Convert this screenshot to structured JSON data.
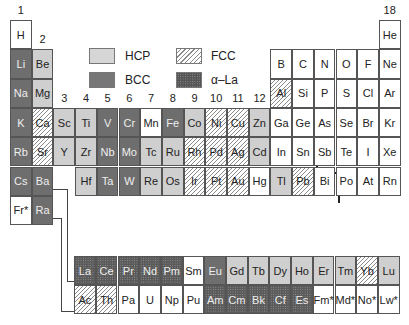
{
  "legend": [
    {
      "key": "hcp",
      "label": "HCP"
    },
    {
      "key": "bcc",
      "label": "BCC"
    },
    {
      "key": "fcc",
      "label": "FCC"
    },
    {
      "key": "ala",
      "label": "α–La"
    }
  ],
  "group_labels": [
    "1",
    "2",
    "3",
    "4",
    "5",
    "6",
    "7",
    "8",
    "9",
    "10",
    "11",
    "12",
    "13",
    "14",
    "15",
    "16",
    "17",
    "18"
  ],
  "main_table": [
    [
      {
        "s": "H",
        "t": "none",
        "c": 1
      },
      {
        "s": "He",
        "t": "none",
        "c": 18
      }
    ],
    [
      {
        "s": "Li",
        "t": "bcc",
        "c": 1
      },
      {
        "s": "Be",
        "t": "hcp",
        "c": 2
      },
      {
        "s": "B",
        "t": "none",
        "c": 13
      },
      {
        "s": "C",
        "t": "none",
        "c": 14
      },
      {
        "s": "N",
        "t": "none",
        "c": 15
      },
      {
        "s": "O",
        "t": "none",
        "c": 16
      },
      {
        "s": "F",
        "t": "none",
        "c": 17
      },
      {
        "s": "Ne",
        "t": "none",
        "c": 18
      }
    ],
    [
      {
        "s": "Na",
        "t": "bcc",
        "c": 1
      },
      {
        "s": "Mg",
        "t": "hcp",
        "c": 2
      },
      {
        "s": "Al",
        "t": "fcc",
        "c": 13
      },
      {
        "s": "Si",
        "t": "none",
        "c": 14
      },
      {
        "s": "P",
        "t": "none",
        "c": 15
      },
      {
        "s": "S",
        "t": "none",
        "c": 16
      },
      {
        "s": "Cl",
        "t": "none",
        "c": 17
      },
      {
        "s": "Ar",
        "t": "none",
        "c": 18
      }
    ],
    [
      {
        "s": "K",
        "t": "bcc",
        "c": 1
      },
      {
        "s": "Ca",
        "t": "fcc",
        "c": 2
      },
      {
        "s": "Sc",
        "t": "hcp",
        "c": 3
      },
      {
        "s": "Ti",
        "t": "hcp",
        "c": 4
      },
      {
        "s": "V",
        "t": "bcc",
        "c": 5
      },
      {
        "s": "Cr",
        "t": "bcc",
        "c": 6
      },
      {
        "s": "Mn",
        "t": "none",
        "c": 7
      },
      {
        "s": "Fe",
        "t": "bcc",
        "c": 8
      },
      {
        "s": "Co",
        "t": "hcp",
        "c": 9
      },
      {
        "s": "Ni",
        "t": "fcc",
        "c": 10
      },
      {
        "s": "Cu",
        "t": "fcc",
        "c": 11
      },
      {
        "s": "Zn",
        "t": "hcp",
        "c": 12
      },
      {
        "s": "Ga",
        "t": "none",
        "c": 13
      },
      {
        "s": "Ge",
        "t": "none",
        "c": 14
      },
      {
        "s": "As",
        "t": "none",
        "c": 15
      },
      {
        "s": "Se",
        "t": "none",
        "c": 16
      },
      {
        "s": "Br",
        "t": "none",
        "c": 17
      },
      {
        "s": "Kr",
        "t": "none",
        "c": 18
      }
    ],
    [
      {
        "s": "Rb",
        "t": "bcc",
        "c": 1
      },
      {
        "s": "Sr",
        "t": "fcc",
        "c": 2
      },
      {
        "s": "Y",
        "t": "hcp",
        "c": 3
      },
      {
        "s": "Zr",
        "t": "hcp",
        "c": 4
      },
      {
        "s": "Nb",
        "t": "bcc",
        "c": 5
      },
      {
        "s": "Mo",
        "t": "bcc",
        "c": 6
      },
      {
        "s": "Tc",
        "t": "hcp",
        "c": 7
      },
      {
        "s": "Ru",
        "t": "hcp",
        "c": 8
      },
      {
        "s": "Rh",
        "t": "fcc",
        "c": 9
      },
      {
        "s": "Pd",
        "t": "fcc",
        "c": 10
      },
      {
        "s": "Ag",
        "t": "fcc",
        "c": 11
      },
      {
        "s": "Cd",
        "t": "hcp",
        "c": 12
      },
      {
        "s": "In",
        "t": "none",
        "c": 13
      },
      {
        "s": "Sn",
        "t": "none",
        "c": 14
      },
      {
        "s": "Sb",
        "t": "none",
        "c": 15
      },
      {
        "s": "Te",
        "t": "none",
        "c": 16
      },
      {
        "s": "I",
        "t": "none",
        "c": 17
      },
      {
        "s": "Xe",
        "t": "none",
        "c": 18
      }
    ],
    [
      {
        "s": "Cs",
        "t": "bcc",
        "c": 1
      },
      {
        "s": "Ba",
        "t": "bcc",
        "c": 2
      },
      {
        "s": "Hf",
        "t": "hcp",
        "c": 4
      },
      {
        "s": "Ta",
        "t": "bcc",
        "c": 5
      },
      {
        "s": "W",
        "t": "bcc",
        "c": 6
      },
      {
        "s": "Re",
        "t": "hcp",
        "c": 7
      },
      {
        "s": "Os",
        "t": "hcp",
        "c": 8
      },
      {
        "s": "Ir",
        "t": "fcc",
        "c": 9
      },
      {
        "s": "Pt",
        "t": "fcc",
        "c": 10
      },
      {
        "s": "Au",
        "t": "fcc",
        "c": 11
      },
      {
        "s": "Hg",
        "t": "none",
        "c": 12
      },
      {
        "s": "Tl",
        "t": "hcp",
        "c": 13
      },
      {
        "s": "Pb",
        "t": "fcc",
        "c": 14
      },
      {
        "s": "Bi",
        "t": "none",
        "c": 15
      },
      {
        "s": "Po",
        "t": "none",
        "c": 16
      },
      {
        "s": "At",
        "t": "none",
        "c": 17
      },
      {
        "s": "Rn",
        "t": "none",
        "c": 18
      }
    ],
    [
      {
        "s": "Fr*",
        "t": "none",
        "c": 1
      },
      {
        "s": "Ra",
        "t": "bcc",
        "c": 2
      }
    ]
  ],
  "lanthanides": [
    {
      "s": "La",
      "t": "ala"
    },
    {
      "s": "Ce",
      "t": "ala"
    },
    {
      "s": "Pr",
      "t": "ala"
    },
    {
      "s": "Nd",
      "t": "ala"
    },
    {
      "s": "Pm",
      "t": "ala"
    },
    {
      "s": "Sm",
      "t": "none"
    },
    {
      "s": "Eu",
      "t": "bcc"
    },
    {
      "s": "Gd",
      "t": "hcp"
    },
    {
      "s": "Tb",
      "t": "hcp"
    },
    {
      "s": "Dy",
      "t": "hcp"
    },
    {
      "s": "Ho",
      "t": "hcp"
    },
    {
      "s": "Er",
      "t": "hcp"
    },
    {
      "s": "Tm",
      "t": "hcp"
    },
    {
      "s": "Yb",
      "t": "fcc"
    },
    {
      "s": "Lu",
      "t": "hcp"
    }
  ],
  "actinides": [
    {
      "s": "Ac",
      "t": "fcc"
    },
    {
      "s": "Th",
      "t": "fcc"
    },
    {
      "s": "Pa",
      "t": "none"
    },
    {
      "s": "U",
      "t": "none"
    },
    {
      "s": "Np",
      "t": "none"
    },
    {
      "s": "Pu",
      "t": "none"
    },
    {
      "s": "Am",
      "t": "ala"
    },
    {
      "s": "Cm",
      "t": "ala"
    },
    {
      "s": "Bk",
      "t": "ala"
    },
    {
      "s": "Cf",
      "t": "ala"
    },
    {
      "s": "Es",
      "t": "ala"
    },
    {
      "s": "Fm*",
      "t": "none"
    },
    {
      "s": "Md*",
      "t": "none"
    },
    {
      "s": "No*",
      "t": "none"
    },
    {
      "s": "Lw*",
      "t": "none"
    }
  ]
}
